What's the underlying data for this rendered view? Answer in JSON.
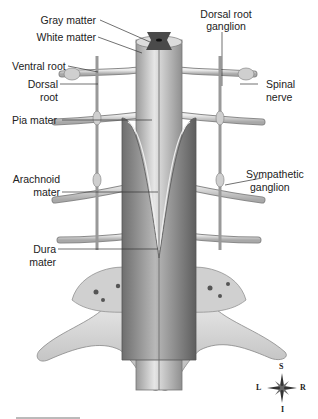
{
  "diagram": {
    "type": "anatomical-illustration",
    "labels": {
      "gray_matter": "Gray matter",
      "white_matter": "White matter",
      "ventral_root": "Ventral root",
      "dorsal_root_line1": "Dorsal",
      "dorsal_root_line2": "root",
      "pia_mater": "Pia mater",
      "arachnoid_line1": "Arachnoid",
      "arachnoid_line2": "mater",
      "dura_line1": "Dura",
      "dura_line2": "mater",
      "drg_line1": "Dorsal root",
      "drg_line2": "ganglion",
      "spinal_nerve_line1": "Spinal",
      "spinal_nerve_line2": "nerve",
      "symp_line1": "Sympathetic",
      "symp_line2": "ganglion"
    },
    "compass": {
      "S": "S",
      "I": "I",
      "L": "L",
      "R": "R"
    },
    "colors": {
      "gray_matter": "#4a4a4a",
      "cord": "#c8c8c8",
      "dura": "#8a8a8a",
      "bone": "#d6d6d6",
      "leader": "#333333"
    }
  }
}
